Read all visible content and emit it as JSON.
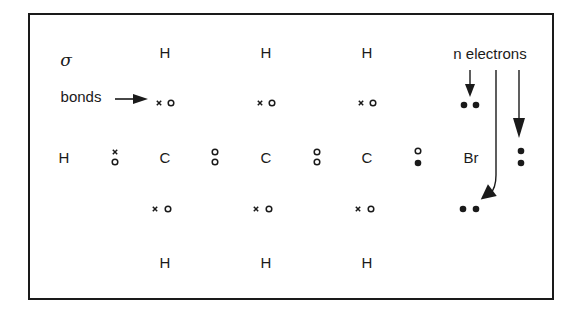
{
  "diagram": {
    "labels": {
      "sigma": "σ",
      "bonds": "bonds",
      "n_electrons": "n electrons"
    },
    "atoms": {
      "h_left": "H",
      "c1": "C",
      "c2": "C",
      "c3": "C",
      "br": "Br",
      "h_top_1": "H",
      "h_top_2": "H",
      "h_top_3": "H",
      "h_bottom_1": "H",
      "h_bottom_2": "H",
      "h_bottom_3": "H"
    },
    "legend": {
      "x": "electron from carbon/hydrogen (x)",
      "o": "electron (o)",
      "filled_dot": "n electron (•)"
    },
    "colors": {
      "ink": "#1a1a1a",
      "background": "#ffffff"
    }
  }
}
